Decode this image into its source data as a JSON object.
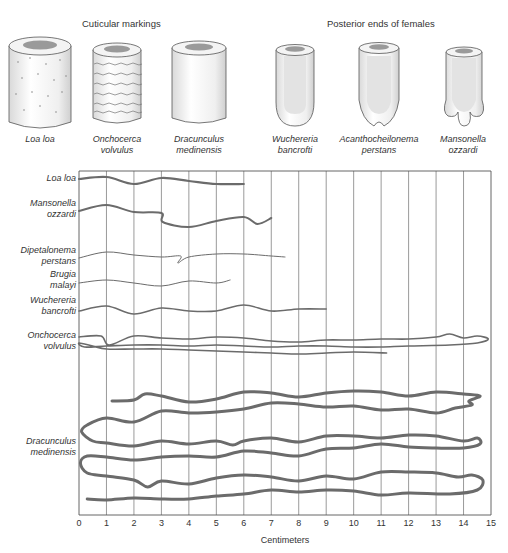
{
  "illustrations": {
    "cuticular_title": "Cuticular markings",
    "posterior_title": "Posterior ends of females",
    "cuticular": [
      {
        "id": "loa-loa",
        "label_lines": [
          "Loa loa"
        ],
        "marking": "dots",
        "cx": 40
      },
      {
        "id": "onchocerca-volvulus",
        "label_lines": [
          "Onchocerca",
          "volvulus"
        ],
        "marking": "wavy-rings",
        "cx": 117
      },
      {
        "id": "dracunculus-medinensis",
        "label_lines": [
          "Dracunculus",
          "medinensis"
        ],
        "marking": "smooth",
        "cx": 199
      }
    ],
    "posterior": [
      {
        "id": "wuchereria-bancrofti",
        "label_lines": [
          "Wuchereria",
          "bancrofti"
        ],
        "shape": "rounded",
        "cx": 295
      },
      {
        "id": "acanthocheilonema-perstans",
        "label_lines": [
          "Acanthocheilonema",
          "perstans"
        ],
        "shape": "bilobed",
        "cx": 379
      },
      {
        "id": "mansonella-ozzardi",
        "label_lines": [
          "Mansonella",
          "ozzardi"
        ],
        "shape": "trilobed",
        "cx": 463
      }
    ]
  },
  "chart_data": {
    "type": "diagram",
    "xlabel": "Centimeters",
    "xlim": [
      0,
      15
    ],
    "xticks": [
      0,
      1,
      2,
      3,
      4,
      5,
      6,
      7,
      8,
      9,
      10,
      11,
      12,
      13,
      14,
      15
    ],
    "grid": "vertical lines at every centimeter",
    "species": [
      {
        "name": "Loa loa",
        "label_lines": [
          "Loa loa"
        ],
        "approx_length_cm": 6,
        "stroke": 2.2,
        "segments": [
          [
            [
              0,
              179
            ],
            [
              1,
              177
            ],
            [
              2,
              184
            ],
            [
              3,
              178
            ],
            [
              4,
              181
            ],
            [
              5,
              184
            ],
            [
              6,
              184
            ]
          ]
        ]
      },
      {
        "name": "Mansonella ozzardi",
        "label_lines": [
          "Mansonella",
          "ozzardi"
        ],
        "approx_length_cm": 7,
        "stroke": 2.0,
        "segments": [
          [
            [
              0,
              211
            ],
            [
              1,
              205
            ],
            [
              2,
              212
            ],
            [
              3,
              213
            ],
            [
              3.05,
              222
            ],
            [
              4,
              227
            ],
            [
              5,
              221
            ],
            [
              6,
              217
            ],
            [
              6.5,
              224
            ],
            [
              7,
              218
            ]
          ]
        ]
      },
      {
        "name": "Dipetalonema perstans",
        "label_lines": [
          "Dipetalonema",
          "perstans"
        ],
        "approx_length_cm": 7.5,
        "stroke": 1.0,
        "segments": [
          [
            [
              0,
              258
            ],
            [
              1,
              252
            ],
            [
              2,
              255
            ],
            [
              3,
              257
            ],
            [
              3.7,
              256
            ],
            [
              3.6,
              263
            ],
            [
              4,
              257
            ],
            [
              5,
              254
            ],
            [
              6,
              254
            ],
            [
              7,
              256
            ],
            [
              7.5,
              257
            ]
          ]
        ]
      },
      {
        "name": "Brugia malayi",
        "label_lines": [
          "Brugia",
          "malayi"
        ],
        "approx_length_cm": 5.5,
        "stroke": 1.0,
        "segments": [
          [
            [
              0,
              283
            ],
            [
              1,
              280
            ],
            [
              2,
              283
            ],
            [
              3,
              286
            ],
            [
              4,
              281
            ],
            [
              5,
              283
            ],
            [
              5.5,
              280
            ]
          ]
        ]
      },
      {
        "name": "Wuchereria bancrofti",
        "label_lines": [
          "Wuchereria",
          "bancrofti"
        ],
        "approx_length_cm": 9,
        "stroke": 1.6,
        "segments": [
          [
            [
              0,
              311
            ],
            [
              1,
              306
            ],
            [
              2,
              314
            ],
            [
              3,
              308
            ],
            [
              4,
              311
            ],
            [
              5,
              311
            ],
            [
              6,
              305
            ],
            [
              7,
              311
            ],
            [
              8,
              309
            ],
            [
              9,
              309
            ]
          ]
        ]
      },
      {
        "name": "Onchocerca volvulus",
        "label_lines": [
          "Onchocerca",
          "volvulus"
        ],
        "approx_length_cm": 50,
        "stroke": 1.6,
        "segments": [
          [
            [
              0,
              337
            ],
            [
              0.8,
              336
            ],
            [
              1.1,
              345
            ],
            [
              2,
              336
            ],
            [
              3,
              338
            ],
            [
              4,
              339
            ],
            [
              5,
              337
            ],
            [
              6,
              338
            ],
            [
              7,
              341
            ],
            [
              8,
              342
            ],
            [
              9,
              340
            ],
            [
              10,
              340
            ],
            [
              11,
              339
            ],
            [
              12,
              339
            ],
            [
              13,
              337
            ],
            [
              13.5,
              334
            ],
            [
              14,
              338
            ],
            [
              14.5,
              336
            ],
            [
              14.9,
              339
            ],
            [
              14.5,
              343
            ],
            [
              13.5,
              345
            ],
            [
              12,
              346
            ],
            [
              11,
              347
            ],
            [
              10,
              347
            ],
            [
              9,
              346
            ],
            [
              8,
              346
            ],
            [
              7,
              347
            ],
            [
              6,
              346
            ],
            [
              5,
              345
            ],
            [
              4,
              346
            ],
            [
              3,
              345
            ],
            [
              2,
              345
            ],
            [
              1,
              346
            ],
            [
              0.2,
              347
            ],
            [
              0,
              343
            ],
            [
              0.5,
              346
            ],
            [
              1,
              349
            ],
            [
              2,
              349
            ],
            [
              3,
              349
            ],
            [
              4,
              350
            ],
            [
              5,
              351
            ],
            [
              6,
              352
            ],
            [
              7,
              353
            ],
            [
              8,
              354
            ],
            [
              9,
              353
            ],
            [
              10,
              352
            ],
            [
              11.2,
              353
            ]
          ]
        ]
      },
      {
        "name": "Dracunculus medinensis",
        "label_lines": [
          "Dracunculus",
          "medinensis"
        ],
        "approx_length_cm": 100,
        "stroke": 3.0,
        "segments": [
          [
            [
              1.2,
              401
            ],
            [
              2,
              400
            ],
            [
              2.4,
              394
            ],
            [
              3,
              396
            ],
            [
              4,
              402
            ],
            [
              5,
              399
            ],
            [
              6,
              392
            ],
            [
              7,
              393
            ],
            [
              8,
              397
            ],
            [
              9,
              393
            ],
            [
              10,
              391
            ],
            [
              11,
              392
            ],
            [
              12,
              396
            ],
            [
              13,
              392
            ],
            [
              14,
              394
            ],
            [
              14.6,
              396
            ],
            [
              14.2,
              401
            ],
            [
              14.3,
              405
            ],
            [
              13.7,
              408
            ],
            [
              13,
              413
            ],
            [
              12,
              409
            ],
            [
              11,
              410
            ],
            [
              10,
              406
            ],
            [
              9,
              407
            ],
            [
              8,
              404
            ],
            [
              7,
              403
            ],
            [
              6,
              409
            ],
            [
              5,
              412
            ],
            [
              4,
              413
            ],
            [
              3,
              411
            ],
            [
              2,
              422
            ],
            [
              1,
              418
            ],
            [
              0.3,
              425
            ],
            [
              0.1,
              432
            ],
            [
              0.5,
              441
            ],
            [
              1,
              443
            ],
            [
              2,
              446
            ],
            [
              3,
              441
            ],
            [
              4,
              444
            ],
            [
              5,
              441
            ],
            [
              5.6,
              445
            ],
            [
              6,
              441
            ],
            [
              7,
              438
            ],
            [
              8,
              442
            ],
            [
              9,
              436
            ],
            [
              10,
              436
            ],
            [
              11,
              438
            ],
            [
              12,
              435
            ],
            [
              13,
              436
            ],
            [
              14,
              441
            ],
            [
              14.5,
              438
            ],
            [
              14.6,
              444
            ],
            [
              14,
              448
            ],
            [
              13,
              448
            ],
            [
              12,
              447
            ],
            [
              11,
              444
            ],
            [
              10,
              448
            ],
            [
              9,
              449
            ],
            [
              8,
              456
            ],
            [
              7,
              453
            ],
            [
              6,
              451
            ],
            [
              5,
              457
            ],
            [
              4,
              456
            ],
            [
              3,
              457
            ],
            [
              2,
              460
            ],
            [
              1,
              457
            ],
            [
              0.3,
              456
            ],
            [
              0.05,
              463
            ],
            [
              0.3,
              473
            ],
            [
              1,
              476
            ],
            [
              2,
              480
            ],
            [
              2.5,
              487
            ],
            [
              3,
              481
            ],
            [
              4,
              484
            ],
            [
              5,
              478
            ],
            [
              6,
              475
            ],
            [
              7,
              477
            ],
            [
              8,
              481
            ],
            [
              9,
              476
            ],
            [
              10,
              479
            ],
            [
              11,
              472
            ],
            [
              12,
              472
            ],
            [
              13,
              473
            ],
            [
              13.8,
              477
            ],
            [
              14.3,
              475
            ],
            [
              14.7,
              480
            ],
            [
              14.5,
              490
            ],
            [
              13.5,
              494
            ],
            [
              12,
              493
            ],
            [
              11,
              495
            ],
            [
              10,
              491
            ],
            [
              9,
              490
            ],
            [
              8,
              492
            ],
            [
              7,
              490
            ],
            [
              6,
              494
            ],
            [
              5,
              496
            ],
            [
              4,
              499
            ],
            [
              3,
              499
            ],
            [
              2,
              498
            ],
            [
              1,
              500
            ],
            [
              0.3,
              499
            ]
          ]
        ]
      }
    ],
    "label_y": [
      [
        180
      ],
      [
        205,
        216
      ],
      [
        252,
        263
      ],
      [
        276,
        287
      ],
      [
        302,
        313
      ],
      [
        337,
        348
      ],
      [
        443,
        454
      ]
    ]
  },
  "axis": {
    "x_title": "Centimeters",
    "tick_labels": [
      "0",
      "1",
      "2",
      "3",
      "4",
      "5",
      "6",
      "7",
      "8",
      "9",
      "10",
      "11",
      "12",
      "13",
      "14",
      "15"
    ]
  },
  "colors": {
    "worm": "#6b6b6b",
    "grid": "#555555",
    "text": "#333333"
  }
}
